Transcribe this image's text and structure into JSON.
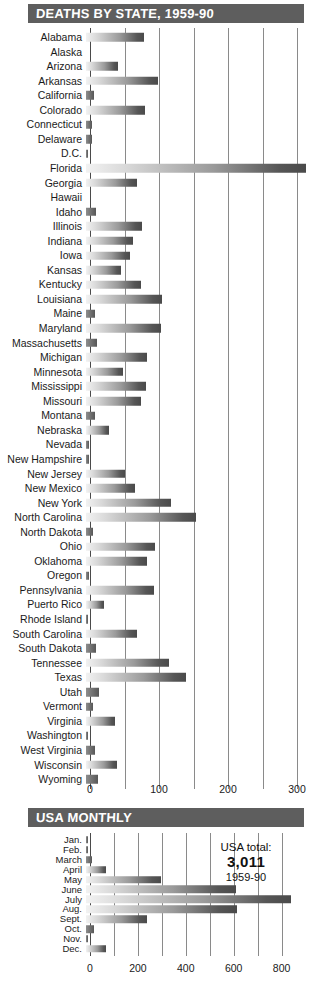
{
  "state_panel": {
    "title": "DEATHS BY STATE, 1959-90",
    "axis_ticks": [
      "0",
      "100",
      "200",
      "300"
    ]
  },
  "monthly_panel": {
    "title": "USA MONTHLY",
    "axis_ticks": [
      "0",
      "200",
      "400",
      "600",
      "800"
    ],
    "note_label": "USA total:",
    "note_value": "3,011",
    "note_years": "1959-90"
  },
  "colors": {
    "banner": "#5e5e5e",
    "banner_text": "#ffffff",
    "bar_light": "#f2f2f2",
    "bar_dark": "#4a4a4a",
    "gridline": "#8a8a8a",
    "text": "#1a1a1a"
  },
  "chart_data": [
    {
      "type": "bar",
      "orientation": "horizontal",
      "title": "DEATHS BY STATE, 1959-90",
      "xlabel": "",
      "ylabel": "",
      "xlim": [
        0,
        320
      ],
      "ticks": [
        0,
        100,
        200,
        300
      ],
      "minor_ticks": [
        50,
        150,
        250
      ],
      "grid": true,
      "legend": "none",
      "categories": [
        "Alabama",
        "Alaska",
        "Arizona",
        "Arkansas",
        "California",
        "Colorado",
        "Connecticut",
        "Delaware",
        "D.C.",
        "Florida",
        "Georgia",
        "Hawaii",
        "Idaho",
        "Illinois",
        "Indiana",
        "Iowa",
        "Kansas",
        "Kentucky",
        "Louisiana",
        "Maine",
        "Maryland",
        "Massachusetts",
        "Michigan",
        "Minnesota",
        "Mississippi",
        "Missouri",
        "Montana",
        "Nebraska",
        "Nevada",
        "New Hampshire",
        "New Jersey",
        "New Mexico",
        "New Mexico2",
        "New York",
        "North Carolina",
        "North Dakota",
        "Ohio",
        "Oklahoma",
        "Oregon",
        "Pennsylvania",
        "Puerto Rico",
        "Rhode Island",
        "South Carolina",
        "South Dakota",
        "Tennessee",
        "Texas",
        "Utah",
        "Vermont",
        "Virginia",
        "Washington",
        "West Virginia",
        "Wisconsin",
        "Wyoming"
      ],
      "values": [
        84,
        0,
        47,
        104,
        12,
        85,
        8,
        9,
        3,
        319,
        74,
        0,
        14,
        81,
        68,
        64,
        51,
        80,
        110,
        13,
        108,
        16,
        89,
        53,
        87,
        79,
        13,
        34,
        4,
        4,
        56,
        71,
        0,
        123,
        160,
        10,
        100,
        88,
        4,
        99,
        26,
        3,
        74,
        14,
        120,
        145,
        19,
        10,
        42,
        1,
        13,
        45,
        18
      ]
    },
    {
      "type": "bar",
      "orientation": "horizontal",
      "title": "USA MONTHLY",
      "xlabel": "",
      "ylabel": "",
      "xlim": [
        0,
        880
      ],
      "ticks": [
        0,
        200,
        400,
        600,
        800
      ],
      "minor_ticks": [
        100,
        300,
        500,
        700
      ],
      "grid": true,
      "legend": "none",
      "annotation": "USA total: 3,011 (1959-90)",
      "categories": [
        "Jan.",
        "Feb.",
        "March",
        "April",
        "May",
        "June",
        "July",
        "Aug.",
        "Sept.",
        "Oct.",
        "Nov.",
        "Dec."
      ],
      "values": [
        4,
        6,
        25,
        85,
        312,
        625,
        855,
        630,
        255,
        32,
        10,
        85
      ]
    }
  ],
  "states": [
    {
      "label": "Alabama",
      "value": 84
    },
    {
      "label": "Alaska",
      "value": 0
    },
    {
      "label": "Arizona",
      "value": 47
    },
    {
      "label": "Arkansas",
      "value": 104
    },
    {
      "label": "California",
      "value": 12
    },
    {
      "label": "Colorado",
      "value": 85
    },
    {
      "label": "Connecticut",
      "value": 8
    },
    {
      "label": "Delaware",
      "value": 9
    },
    {
      "label": "D.C.",
      "value": 3
    },
    {
      "label": "Florida",
      "value": 319
    },
    {
      "label": "Georgia",
      "value": 74
    },
    {
      "label": "Hawaii",
      "value": 0
    },
    {
      "label": "Idaho",
      "value": 14
    },
    {
      "label": "Illinois",
      "value": 81
    },
    {
      "label": "Indiana",
      "value": 68
    },
    {
      "label": "Iowa",
      "value": 64
    },
    {
      "label": "Kansas",
      "value": 51
    },
    {
      "label": "Kentucky",
      "value": 80
    },
    {
      "label": "Louisiana",
      "value": 110
    },
    {
      "label": "Maine",
      "value": 13
    },
    {
      "label": "Maryland",
      "value": 108
    },
    {
      "label": "Massachusetts",
      "value": 16
    },
    {
      "label": "Michigan",
      "value": 89
    },
    {
      "label": "Minnesota",
      "value": 53
    },
    {
      "label": "Mississippi",
      "value": 87
    },
    {
      "label": "Missouri",
      "value": 79
    },
    {
      "label": "Montana",
      "value": 13
    },
    {
      "label": "Nebraska",
      "value": 34
    },
    {
      "label": "Nevada",
      "value": 4
    },
    {
      "label": "New Hampshire",
      "value": 4
    },
    {
      "label": "New Jersey",
      "value": 56
    },
    {
      "label": "New Mexico",
      "value": 71
    },
    {
      "label": "New York",
      "value": 123
    },
    {
      "label": "North Carolina",
      "value": 160
    },
    {
      "label": "North Dakota",
      "value": 10
    },
    {
      "label": "Ohio",
      "value": 100
    },
    {
      "label": "Oklahoma",
      "value": 88
    },
    {
      "label": "Oregon",
      "value": 4
    },
    {
      "label": "Pennsylvania",
      "value": 99
    },
    {
      "label": "Puerto Rico",
      "value": 26
    },
    {
      "label": "Rhode Island",
      "value": 3
    },
    {
      "label": "South Carolina",
      "value": 74
    },
    {
      "label": "South Dakota",
      "value": 14
    },
    {
      "label": "Tennessee",
      "value": 120
    },
    {
      "label": "Texas",
      "value": 145
    },
    {
      "label": "Utah",
      "value": 19
    },
    {
      "label": "Vermont",
      "value": 10
    },
    {
      "label": "Virginia",
      "value": 42
    },
    {
      "label": "Washington",
      "value": 1
    },
    {
      "label": "West Virginia",
      "value": 13
    },
    {
      "label": "Wisconsin",
      "value": 45
    },
    {
      "label": "Wyoming",
      "value": 18
    }
  ],
  "months": [
    {
      "label": "Jan.",
      "value": 4
    },
    {
      "label": "Feb.",
      "value": 6
    },
    {
      "label": "March",
      "value": 25
    },
    {
      "label": "April",
      "value": 85
    },
    {
      "label": "May",
      "value": 312
    },
    {
      "label": "June",
      "value": 625
    },
    {
      "label": "July",
      "value": 855
    },
    {
      "label": "Aug.",
      "value": 630
    },
    {
      "label": "Sept.",
      "value": 255
    },
    {
      "label": "Oct.",
      "value": 32
    },
    {
      "label": "Nov.",
      "value": 10
    },
    {
      "label": "Dec.",
      "value": 85
    }
  ]
}
